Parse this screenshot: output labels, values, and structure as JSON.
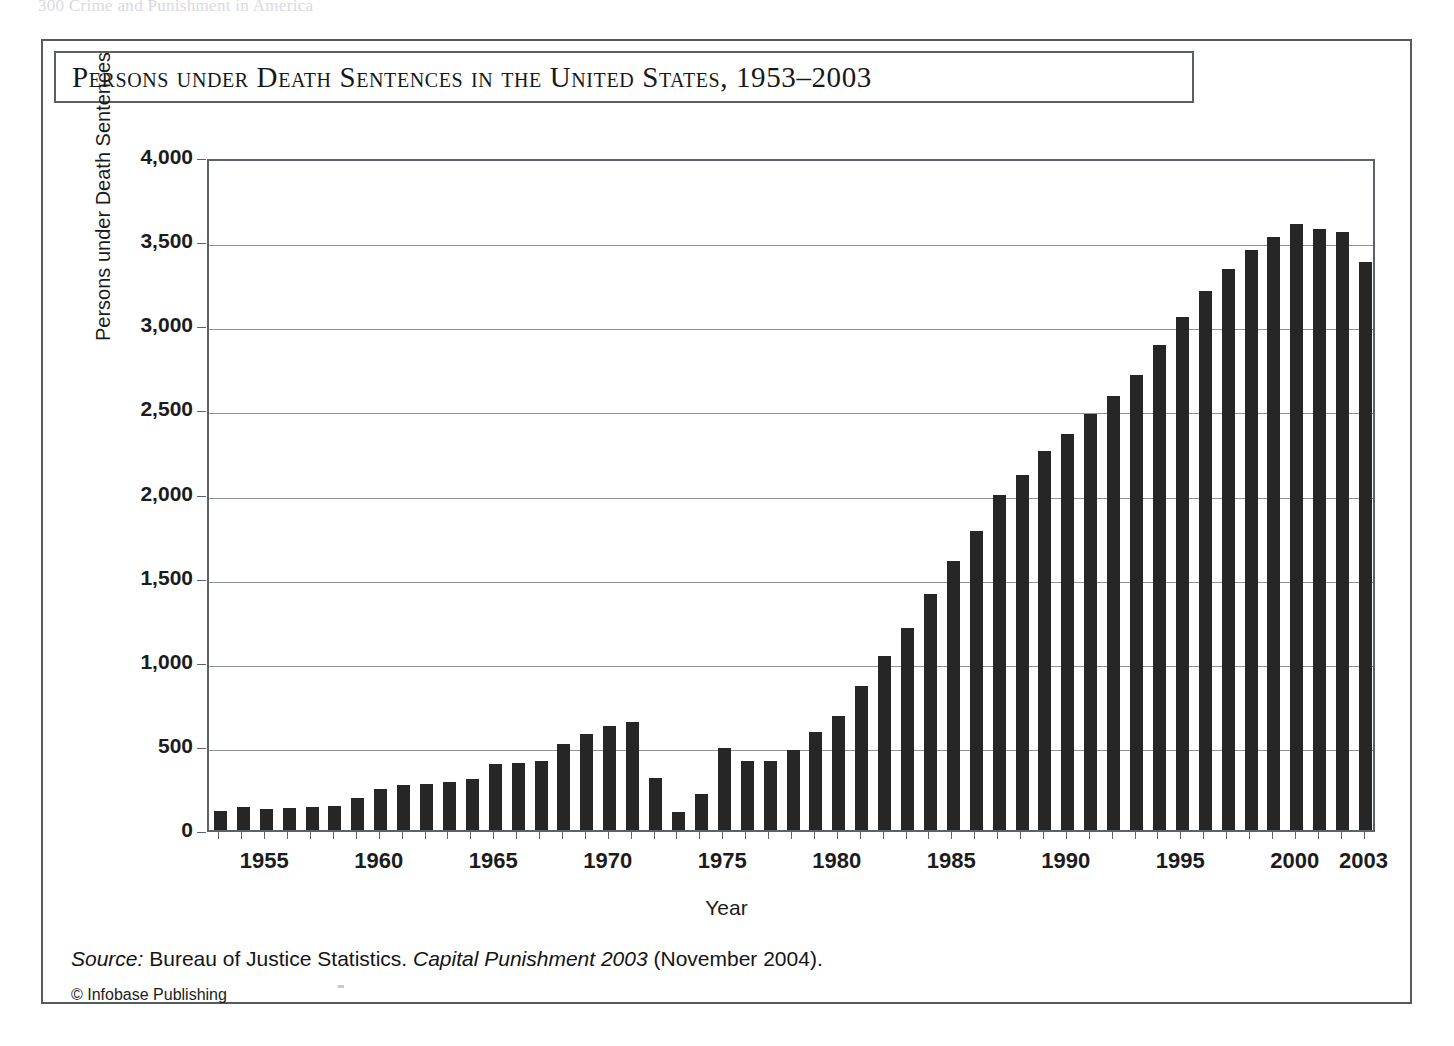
{
  "page": {
    "running_header": "300    Crime and Punishment in America"
  },
  "figure": {
    "title": "Persons under Death Sentences in the United States, 1953–2003",
    "source_prefix": "Source:",
    "source_text_1": " Bureau of Justice Statistics. ",
    "source_italic_2": "Capital Punishment 2003",
    "source_text_2": " (November 2004).",
    "copyright": "© Infobase Publishing"
  },
  "chart_data": {
    "type": "bar",
    "title": "Persons under Death Sentences in the United States, 1953–2003",
    "xlabel": "Year",
    "ylabel": "Persons under Death Sentences",
    "ylim": [
      0,
      4000
    ],
    "ytick_values": [
      0,
      500,
      1000,
      1500,
      2000,
      2500,
      3000,
      3500,
      4000
    ],
    "ytick_labels": [
      "0",
      "500",
      "1,000",
      "1,500",
      "2,000",
      "2,500",
      "3,000",
      "3,500",
      "4,000"
    ],
    "xtick_labels": [
      "1955",
      "1960",
      "1965",
      "1970",
      "1975",
      "1980",
      "1985",
      "1990",
      "1995",
      "2000",
      "2003"
    ],
    "grid": true,
    "legend": "none",
    "bar_color": "#262626",
    "categories": [
      1953,
      1954,
      1955,
      1956,
      1957,
      1958,
      1959,
      1960,
      1961,
      1962,
      1963,
      1964,
      1965,
      1966,
      1967,
      1968,
      1969,
      1970,
      1971,
      1972,
      1973,
      1974,
      1975,
      1976,
      1977,
      1978,
      1979,
      1980,
      1981,
      1982,
      1983,
      1984,
      1985,
      1986,
      1987,
      1988,
      1989,
      1990,
      1991,
      1992,
      1993,
      1994,
      1995,
      1996,
      1997,
      1998,
      1999,
      2000,
      2001,
      2002,
      2003
    ],
    "values": [
      115,
      135,
      125,
      130,
      135,
      140,
      190,
      245,
      265,
      275,
      285,
      305,
      390,
      400,
      410,
      510,
      570,
      620,
      640,
      310,
      110,
      215,
      490,
      410,
      410,
      475,
      585,
      680,
      855,
      1035,
      1200,
      1405,
      1600,
      1775,
      1990,
      2110,
      2255,
      2355,
      2475,
      2580,
      2705,
      2880,
      3050,
      3205,
      3335,
      3450,
      3525,
      3600,
      3575,
      3555,
      3375
    ]
  }
}
